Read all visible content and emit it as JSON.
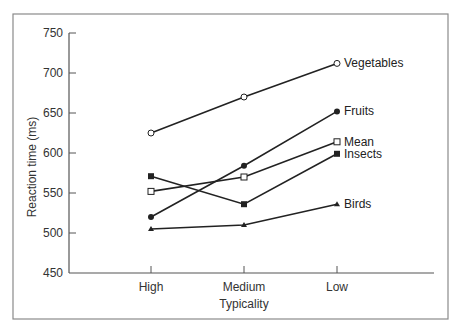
{
  "chart_data": {
    "type": "line",
    "title": "",
    "xlabel": "Typicality",
    "ylabel": "Reaction time (ms)",
    "categories": [
      "High",
      "Medium",
      "Low"
    ],
    "ylim": [
      450,
      750
    ],
    "yticks": [
      450,
      500,
      550,
      600,
      650,
      700,
      750
    ],
    "grid": false,
    "legend_position": "inline-right",
    "series": [
      {
        "name": "Vegetables",
        "marker": "open-circle",
        "values": [
          625,
          670,
          712
        ]
      },
      {
        "name": "Fruits",
        "marker": "filled-circle",
        "values": [
          520,
          584,
          652
        ]
      },
      {
        "name": "Mean",
        "marker": "open-square",
        "values": [
          552,
          570,
          614
        ]
      },
      {
        "name": "Insects",
        "marker": "filled-square",
        "values": [
          571,
          536,
          599
        ]
      },
      {
        "name": "Birds",
        "marker": "filled-triangle",
        "values": [
          505,
          510,
          536
        ]
      }
    ]
  },
  "colors": {
    "line": "#222222",
    "frame": "#8a8a8a",
    "axis": "#555555",
    "background": "#ffffff"
  }
}
